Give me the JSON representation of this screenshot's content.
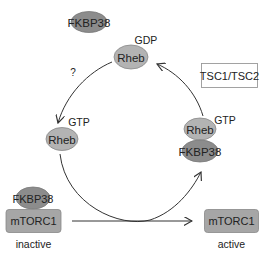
{
  "diagram": {
    "type": "signaling-cycle",
    "colors": {
      "rheb_fill": "#b3b3b3",
      "fkbp38_fill": "#8c8c8c",
      "mtorc1_fill": "#a6a6a6",
      "stroke": "#777777",
      "arrow": "#333333",
      "text": "#222222",
      "box_border": "#999999"
    },
    "nodes": {
      "fkbp38_free": {
        "label": "FKBP38"
      },
      "rheb_gdp": {
        "label": "Rheb",
        "state": "GDP"
      },
      "rheb_gtp_left": {
        "label": "Rheb",
        "state": "GTP"
      },
      "rheb_gtp_right": {
        "label": "Rheb",
        "state": "GTP"
      },
      "fkbp38_bound_right": {
        "label": "FKBP38"
      },
      "fkbp38_bound_left": {
        "label": "FKBP38"
      },
      "mtorc1_inactive": {
        "label": "mTORC1",
        "status": "inactive"
      },
      "mtorc1_active": {
        "label": "mTORC1",
        "status": "active"
      },
      "tsc_box": {
        "label": "TSC1/TSC2"
      }
    },
    "annotations": {
      "unknown_step": "?"
    },
    "edges": [
      {
        "from": "rheb_gdp",
        "to": "rheb_gtp_left",
        "label": "?"
      },
      {
        "from": "rheb_gtp_left",
        "to": "rheb_gtp_right",
        "label": ""
      },
      {
        "from": "rheb_gtp_right",
        "to": "rheb_gdp",
        "label": "TSC1/TSC2"
      },
      {
        "from": "mtorc1_inactive",
        "to": "mtorc1_active",
        "label": ""
      }
    ]
  }
}
